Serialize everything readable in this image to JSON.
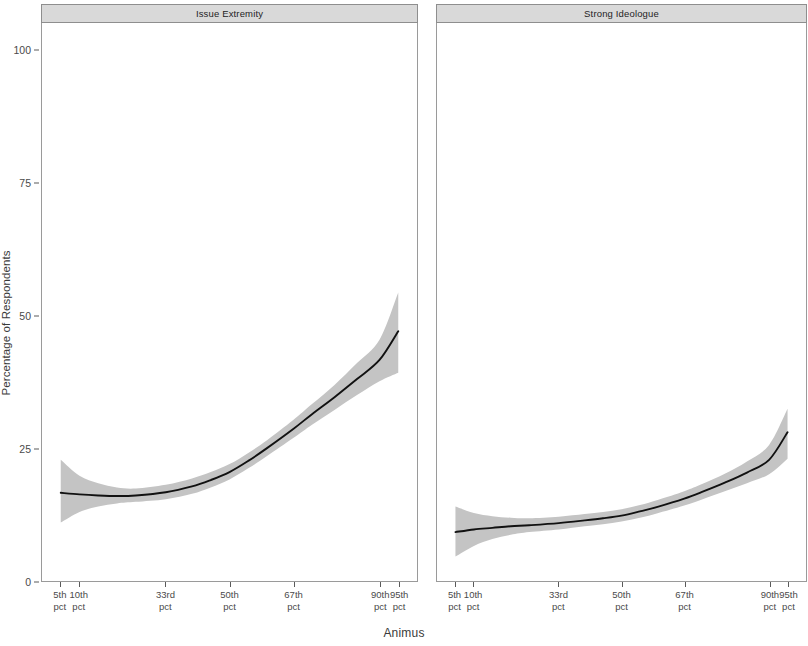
{
  "chart_data": {
    "type": "line",
    "title": "",
    "xlabel": "Animus",
    "ylabel": "Percentage of Respondents",
    "ylim": [
      0,
      105
    ],
    "xlim": [
      0,
      100
    ],
    "yticks": [
      0,
      25,
      50,
      75,
      100
    ],
    "ytick_labels": [
      "0",
      "25",
      "50",
      "75",
      "100"
    ],
    "xticks": [
      5,
      10,
      33,
      50,
      67,
      90,
      95
    ],
    "xtick_labels": [
      "5th\npct",
      "10th\npct",
      "33rd\npct",
      "50th\npct",
      "67th\npct",
      "90th\npct",
      "95th\npct"
    ],
    "xtick_lines": [
      {
        "top": "5th",
        "bottom": "pct"
      },
      {
        "top": "10th",
        "bottom": "pct"
      },
      {
        "top": "33rd",
        "bottom": "pct"
      },
      {
        "top": "50th",
        "bottom": "pct"
      },
      {
        "top": "67th",
        "bottom": "pct"
      },
      {
        "top": "90th",
        "bottom": "pct"
      },
      {
        "top": "95th",
        "bottom": "pct"
      }
    ],
    "grid": false,
    "legend": "none",
    "line_color": "#111111",
    "ribbon_color": "#c4c4c4",
    "strip_background": "#d9d9d9",
    "panel_background": "#ffffff",
    "facets": [
      {
        "label": "Issue Extremity",
        "series": [
          {
            "name": "Predicted percentage",
            "x": [
              5,
              10,
              15,
              20,
              25,
              33,
              40,
              45,
              50,
              55,
              60,
              67,
              72,
              78,
              84,
              90,
              95
            ],
            "y": [
              16.6,
              16.3,
              16.1,
              16.0,
              16.1,
              16.7,
              17.8,
              19.0,
              20.5,
              22.6,
              25.0,
              28.6,
              31.4,
              34.6,
              38.0,
              41.6,
              47.0
            ],
            "y_low": [
              11.0,
              13.0,
              14.0,
              14.6,
              14.9,
              15.4,
              16.4,
              17.6,
              19.1,
              21.2,
              23.5,
              26.9,
              29.4,
              32.2,
              35.0,
              37.6,
              39.2
            ],
            "y_high": [
              22.8,
              19.8,
              18.4,
              17.6,
              17.4,
              18.1,
              19.3,
              20.5,
              22.0,
              24.1,
              26.5,
              30.3,
              33.3,
              36.9,
              41.0,
              45.4,
              54.3
            ]
          }
        ]
      },
      {
        "label": "Strong Ideologue",
        "series": [
          {
            "name": "Predicted percentage",
            "x": [
              5,
              10,
              15,
              20,
              25,
              33,
              40,
              45,
              50,
              55,
              60,
              67,
              72,
              78,
              84,
              90,
              95
            ],
            "y": [
              9.2,
              9.7,
              10.0,
              10.3,
              10.5,
              10.9,
              11.4,
              11.8,
              12.3,
              13.1,
              14.0,
              15.5,
              16.8,
              18.5,
              20.4,
              22.8,
              28.0
            ],
            "y_low": [
              4.6,
              6.6,
              7.9,
              8.7,
              9.2,
              9.7,
              10.3,
              10.7,
              11.2,
              11.9,
              12.8,
              14.2,
              15.4,
              16.9,
              18.4,
              20.1,
              23.0
            ],
            "y_high": [
              14.0,
              12.8,
              12.2,
              11.9,
              11.8,
              12.1,
              12.6,
              13.0,
              13.5,
              14.3,
              15.3,
              16.9,
              18.3,
              20.2,
              22.5,
              25.6,
              32.4
            ]
          }
        ]
      }
    ]
  },
  "axis": {
    "y_title": "Percentage of Respondents",
    "x_title": "Animus"
  }
}
